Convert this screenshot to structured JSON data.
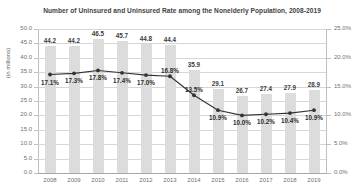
{
  "chart_data": {
    "type": "bar",
    "title": "Number of Uninsured and Uninsured Rate among the Nonelderly Population, 2008-2019",
    "xlabel": "",
    "ylabel": "(in millions)",
    "y2label": "",
    "grid": true,
    "legend": "none",
    "categories": [
      "2008",
      "2009",
      "2010",
      "2011",
      "2012",
      "2013",
      "2014",
      "2015",
      "2016",
      "2017",
      "2018",
      "2019"
    ],
    "ylim": [
      0.0,
      50.0
    ],
    "y2lim": [
      0.0,
      25.0
    ],
    "yticks": [
      "0.0",
      "5.0",
      "10.0",
      "15.0",
      "20.0",
      "25.0",
      "30.0",
      "35.0",
      "40.0",
      "45.0",
      "50.0"
    ],
    "y2ticks": [
      "0.0%",
      "5.0%",
      "10.0%",
      "15.0%",
      "20.0%",
      "25.0%"
    ],
    "series": [
      {
        "name": "Number of Uninsured (in millions)",
        "type": "bar",
        "axis": "left",
        "color": "#dcdcdc",
        "values": [
          44.2,
          44.2,
          46.5,
          45.7,
          44.8,
          44.4,
          35.9,
          29.1,
          26.7,
          27.4,
          27.9,
          28.9
        ],
        "labels": [
          "44.2",
          "44.2",
          "46.5",
          "45.7",
          "44.8",
          "44.4",
          "35.9",
          "29.1",
          "26.7",
          "27.4",
          "27.9",
          "28.9"
        ]
      },
      {
        "name": "Uninsured Rate",
        "type": "line",
        "axis": "right",
        "color": "#333333",
        "values": [
          17.1,
          17.3,
          17.8,
          17.4,
          17.0,
          16.8,
          13.5,
          10.9,
          10.0,
          10.2,
          10.4,
          10.9
        ],
        "labels": [
          "17.1%",
          "17.3%",
          "17.8%",
          "17.4%",
          "17.0%",
          "16.8%",
          "13.5%",
          "10.9%",
          "10.0%",
          "10.2%",
          "10.4%",
          "10.9%"
        ]
      }
    ]
  }
}
